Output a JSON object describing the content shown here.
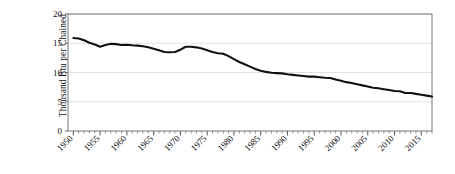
{
  "chart_data": {
    "type": "line",
    "title": "",
    "xlabel": "",
    "ylabel_line1": "Thousand Btu per Chained",
    "ylabel_line2": "(2009) Dollar",
    "ylim": [
      0,
      20
    ],
    "xlim": [
      1949,
      2017
    ],
    "y_ticks": [
      0,
      5,
      10,
      15,
      20
    ],
    "y_tick_labels": [
      "0",
      "5",
      "10",
      "15",
      "20"
    ],
    "x_ticks": [
      1950,
      1955,
      1960,
      1965,
      1970,
      1975,
      1980,
      1985,
      1990,
      1995,
      2000,
      2005,
      2010,
      2015
    ],
    "x_tick_labels": [
      "1950",
      "1955",
      "1960",
      "1965",
      "1970",
      "1975",
      "1980",
      "1985",
      "1990",
      "1995",
      "2000",
      "2005",
      "2010",
      "2015"
    ],
    "x_minor_tick_interval": 1,
    "grid": "horizontal",
    "legend": "none",
    "line_color": "#111111",
    "grid_color": "#d9d9d9",
    "series": [
      {
        "name": "Energy intensity",
        "x": [
          1950,
          1951,
          1952,
          1953,
          1954,
          1955,
          1956,
          1957,
          1958,
          1959,
          1960,
          1961,
          1962,
          1963,
          1964,
          1965,
          1966,
          1967,
          1968,
          1969,
          1970,
          1971,
          1972,
          1973,
          1974,
          1975,
          1976,
          1977,
          1978,
          1979,
          1980,
          1981,
          1982,
          1983,
          1984,
          1985,
          1986,
          1987,
          1988,
          1989,
          1990,
          1991,
          1992,
          1993,
          1994,
          1995,
          1996,
          1997,
          1998,
          1999,
          2000,
          2001,
          2002,
          2003,
          2004,
          2005,
          2006,
          2007,
          2008,
          2009,
          2010,
          2011,
          2012,
          2013,
          2014,
          2015,
          2016,
          2017
        ],
        "values": [
          15.9,
          15.8,
          15.5,
          15.1,
          14.8,
          14.4,
          14.7,
          14.9,
          14.85,
          14.7,
          14.75,
          14.65,
          14.6,
          14.5,
          14.3,
          14.05,
          13.8,
          13.5,
          13.45,
          13.5,
          13.9,
          14.4,
          14.4,
          14.3,
          14.1,
          13.8,
          13.5,
          13.3,
          13.2,
          12.8,
          12.3,
          11.8,
          11.4,
          11.0,
          10.6,
          10.3,
          10.1,
          9.95,
          9.9,
          9.85,
          9.7,
          9.6,
          9.5,
          9.4,
          9.3,
          9.3,
          9.2,
          9.1,
          9.05,
          8.8,
          8.6,
          8.35,
          8.2,
          8.0,
          7.8,
          7.6,
          7.4,
          7.3,
          7.15,
          7.0,
          6.85,
          6.8,
          6.5,
          6.5,
          6.35,
          6.2,
          6.05,
          5.9
        ]
      }
    ]
  }
}
